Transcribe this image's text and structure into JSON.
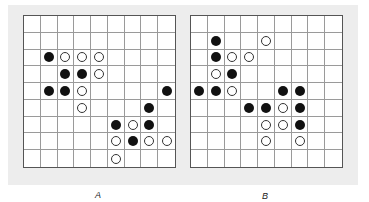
{
  "figure": {
    "grid_size": 9,
    "panels": [
      {
        "label": "A",
        "stones": [
          {
            "row": 2,
            "col": 1,
            "color": "black"
          },
          {
            "row": 2,
            "col": 2,
            "color": "white"
          },
          {
            "row": 2,
            "col": 3,
            "color": "white"
          },
          {
            "row": 2,
            "col": 4,
            "color": "white"
          },
          {
            "row": 3,
            "col": 2,
            "color": "black"
          },
          {
            "row": 3,
            "col": 3,
            "color": "black"
          },
          {
            "row": 3,
            "col": 4,
            "color": "white"
          },
          {
            "row": 4,
            "col": 1,
            "color": "black"
          },
          {
            "row": 4,
            "col": 2,
            "color": "black"
          },
          {
            "row": 4,
            "col": 3,
            "color": "white"
          },
          {
            "row": 4,
            "col": 8,
            "color": "black"
          },
          {
            "row": 5,
            "col": 3,
            "color": "white"
          },
          {
            "row": 5,
            "col": 7,
            "color": "black"
          },
          {
            "row": 6,
            "col": 5,
            "color": "black"
          },
          {
            "row": 6,
            "col": 6,
            "color": "white"
          },
          {
            "row": 6,
            "col": 7,
            "color": "black"
          },
          {
            "row": 7,
            "col": 5,
            "color": "white"
          },
          {
            "row": 7,
            "col": 6,
            "color": "black"
          },
          {
            "row": 7,
            "col": 7,
            "color": "white"
          },
          {
            "row": 7,
            "col": 8,
            "color": "white"
          },
          {
            "row": 8,
            "col": 5,
            "color": "white"
          }
        ]
      },
      {
        "label": "B",
        "stones": [
          {
            "row": 1,
            "col": 1,
            "color": "black"
          },
          {
            "row": 1,
            "col": 4,
            "color": "white"
          },
          {
            "row": 2,
            "col": 1,
            "color": "black"
          },
          {
            "row": 2,
            "col": 2,
            "color": "white"
          },
          {
            "row": 2,
            "col": 3,
            "color": "white"
          },
          {
            "row": 3,
            "col": 1,
            "color": "white"
          },
          {
            "row": 3,
            "col": 2,
            "color": "black"
          },
          {
            "row": 4,
            "col": 0,
            "color": "black"
          },
          {
            "row": 4,
            "col": 1,
            "color": "black"
          },
          {
            "row": 4,
            "col": 2,
            "color": "white"
          },
          {
            "row": 4,
            "col": 5,
            "color": "black"
          },
          {
            "row": 4,
            "col": 6,
            "color": "black"
          },
          {
            "row": 5,
            "col": 3,
            "color": "black"
          },
          {
            "row": 5,
            "col": 4,
            "color": "black"
          },
          {
            "row": 5,
            "col": 5,
            "color": "white"
          },
          {
            "row": 5,
            "col": 6,
            "color": "black"
          },
          {
            "row": 6,
            "col": 4,
            "color": "white"
          },
          {
            "row": 6,
            "col": 5,
            "color": "white"
          },
          {
            "row": 6,
            "col": 6,
            "color": "black"
          },
          {
            "row": 7,
            "col": 4,
            "color": "white"
          },
          {
            "row": 7,
            "col": 6,
            "color": "white"
          }
        ]
      }
    ],
    "colors": {
      "background": "#ededed",
      "grid_line": "#9a9a9a",
      "black_stone": "#111111",
      "white_stone": "#ffffff"
    }
  }
}
